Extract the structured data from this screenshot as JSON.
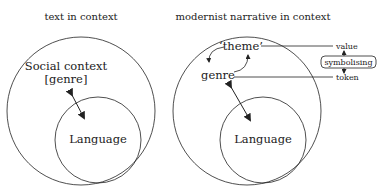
{
  "left_diagram": {
    "title": "text in context",
    "outer_label_line1": "Social context",
    "outer_label_line2": "[genre]",
    "inner_label": "Language"
  },
  "right_diagram": {
    "title": "modernist narrative in context",
    "theme_label": "‘theme’",
    "genre_label": "genre",
    "inner_label": "Language",
    "value_label": "value",
    "symbolising_label": "symbolising",
    "token_label": "token"
  },
  "colors": {
    "stroke": "#222222",
    "text": "#222222",
    "background": "#ffffff"
  }
}
